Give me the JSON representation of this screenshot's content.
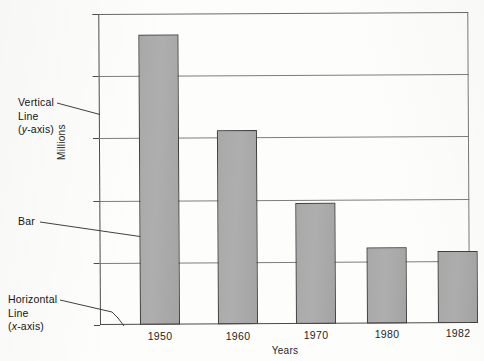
{
  "chart_data": {
    "type": "bar",
    "title": "",
    "subtitle": "",
    "xlabel": "Years",
    "ylabel": "Millions",
    "categories": [
      "1950",
      "1960",
      "1970",
      "1980",
      "1982"
    ],
    "values": [
      23.3,
      15.6,
      9.7,
      6.1,
      5.8
    ],
    "series": [
      {
        "name": "Millions",
        "values": [
          23.3,
          15.6,
          9.7,
          6.1,
          5.8
        ]
      }
    ],
    "ylim": [
      0,
      25
    ],
    "yticks": [
      0,
      5,
      10,
      15,
      20,
      25
    ],
    "ytick_labels": [
      "0",
      "5",
      "10",
      "15",
      "20",
      "25"
    ],
    "grid": true,
    "grid_axis": "y",
    "legend": false,
    "legend_position": "none",
    "bar_fill_color": "#a9a9a9",
    "bar_edge_color": "#3f3f3f",
    "annotations": [
      {
        "id": "y-axis-callout",
        "lines": [
          "Vertical",
          "Line",
          "(y-axis)"
        ],
        "italic_part": "y",
        "target": "y-axis vertical line"
      },
      {
        "id": "bar-callout",
        "lines": [
          "Bar"
        ],
        "italic_part": "",
        "target": "first bar (1950)"
      },
      {
        "id": "x-axis-callout",
        "lines": [
          "Horizontal",
          "Line",
          "(x-axis)"
        ],
        "italic_part": "x",
        "target": "x-axis horizontal baseline"
      }
    ]
  },
  "annotations": {
    "y_axis": {
      "line1": "Vertical",
      "line2": "Line",
      "line3_open": "(",
      "line3_italic": "y",
      "line3_close": "-axis)"
    },
    "bar": {
      "line1": "Bar"
    },
    "x_axis": {
      "line1": "Horizontal",
      "line2": "Line",
      "line3_open": "(",
      "line3_italic": "x",
      "line3_close": "-axis)"
    }
  }
}
